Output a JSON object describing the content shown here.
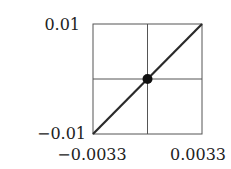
{
  "chart_data": {
    "type": "line",
    "title": "",
    "xlabel": "",
    "ylabel": "",
    "xlim": [
      -0.0033,
      0.0033
    ],
    "ylim": [
      -0.01,
      0.01
    ],
    "x_ticks": [
      -0.0033,
      0.0033
    ],
    "x_tick_labels": [
      "−0.0033",
      "0.0033"
    ],
    "y_ticks": [
      -0.01,
      0.01
    ],
    "y_tick_labels": [
      "−0.01",
      "0.01"
    ],
    "grid": true,
    "grid_lines": {
      "x": [
        0
      ],
      "y": [
        0
      ]
    },
    "series": [
      {
        "name": "line",
        "x": [
          -0.0033,
          0.0033
        ],
        "y": [
          -0.01,
          0.01
        ]
      }
    ],
    "points": [
      {
        "name": "origin",
        "x": 0,
        "y": 0
      }
    ],
    "legend": "none"
  }
}
